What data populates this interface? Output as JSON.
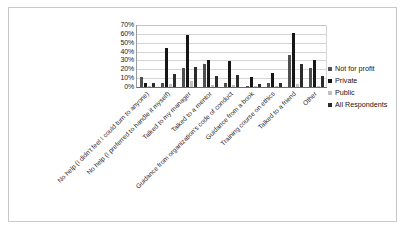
{
  "chart_data": {
    "type": "bar",
    "title": "",
    "xlabel": "",
    "ylabel": "",
    "ylim": [
      0,
      70
    ],
    "y_tick_labels": [
      "70%",
      "60%",
      "50%",
      "40%",
      "30%",
      "20%",
      "10%",
      "0%"
    ],
    "grid": true,
    "legend_position": "right",
    "categories": [
      "No help (I didn't feel I could turn to anyone)",
      "No help (I preferred to handle it myself)",
      "Talked to my manager",
      "Talked to a mentor",
      "Guidance from organization's code of conduct",
      "Guidance from a book",
      "Training course on ethics",
      "Talked to a friend",
      "Other"
    ],
    "series": [
      {
        "name": "Not for profit",
        "color": "#4f4f4f",
        "values": [
          11,
          4,
          21,
          26,
          4,
          0,
          4,
          36,
          21
        ]
      },
      {
        "name": "Private",
        "color": "#161616",
        "values": [
          4,
          44,
          59,
          30,
          29,
          11,
          16,
          61,
          30
        ]
      },
      {
        "name": "Public",
        "color": "#c0c0c0",
        "values": [
          0,
          3,
          7,
          2,
          2,
          0,
          1,
          3,
          1
        ]
      },
      {
        "name": "All Respondents",
        "color": "#2b2b2b",
        "values": [
          5,
          15,
          23,
          12,
          14,
          3,
          5,
          26,
          12
        ]
      }
    ]
  },
  "legend": {
    "items": [
      {
        "label": "Not for profit"
      },
      {
        "label": "Private"
      },
      {
        "label": "Public"
      },
      {
        "label": "All Respondents"
      }
    ]
  }
}
